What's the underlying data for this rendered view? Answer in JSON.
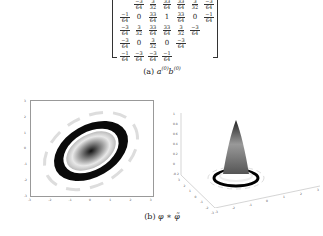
{
  "figure_a": {
    "matrix_rows": [
      [
        "-3/64",
        "3/32",
        "33/64",
        "33/64",
        "3/32",
        "-3/64"
      ],
      [
        "-1/64",
        "0",
        "33/64",
        "1",
        "33/64",
        "0",
        "-1/64"
      ],
      [
        "-3/64",
        "3/32",
        "33/64",
        "33/64",
        "3/32",
        "-3/64"
      ],
      [
        "-3/64",
        "0",
        "3/32",
        "0",
        "-3/64"
      ],
      [
        "-1/64",
        "-3/64",
        "-3/64",
        "-1/64"
      ]
    ],
    "caption_label": "(a)",
    "caption_math": "a(0)b(0)"
  },
  "figure_b": {
    "caption_label": "(b)",
    "caption_math": "φ ∗ φ̃",
    "plot2d": {
      "type": "heatmap",
      "x_ticks": [
        "-3",
        "-2",
        "-1",
        "0",
        "1",
        "2",
        "3"
      ],
      "y_ticks": [
        "3",
        "2",
        "1",
        "0",
        "-1",
        "-2",
        "-3"
      ]
    },
    "plot3d": {
      "type": "surface",
      "z_ticks": [
        "1",
        "0.8",
        "0.6",
        "0.4",
        "0.2",
        "0",
        "-0.2"
      ],
      "x_ticks": [
        "-3",
        "-2",
        "-1",
        "0",
        "1",
        "2",
        "3"
      ],
      "y_ticks": [
        "3",
        "2",
        "1",
        "0",
        "-1",
        "-2",
        "-3"
      ]
    }
  },
  "chart_data": [
    {
      "type": "heatmap",
      "title": "φ ∗ φ̃ (top view)",
      "xlabel": "",
      "ylabel": "",
      "xlim": [
        -3,
        3
      ],
      "ylim": [
        -3,
        3
      ],
      "description": "Tilted elliptical ring pattern with dark outer ring, white inner ring and central peak, oriented along the diagonal"
    },
    {
      "type": "surface",
      "title": "φ ∗ φ̃ (3D)",
      "xlim": [
        -3,
        3
      ],
      "ylim": [
        -3,
        3
      ],
      "zlim": [
        -0.2,
        1
      ],
      "description": "Single central peak reaching about 0.9 with small ripple rings at the base"
    }
  ]
}
